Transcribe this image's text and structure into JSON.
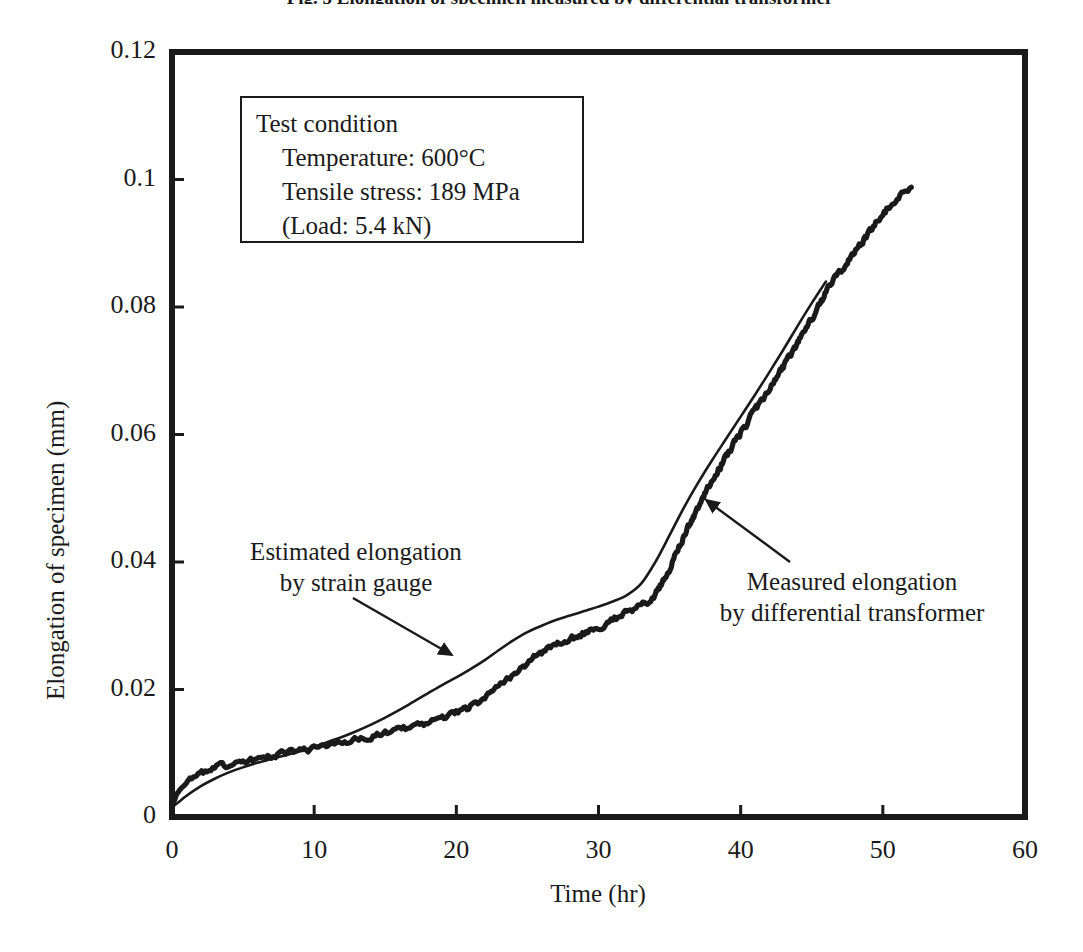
{
  "figure": {
    "caption": "Fig. 5  Elongation of specimen measured by differential transformer"
  },
  "chart_data": {
    "type": "line",
    "title": "",
    "xlabel": "Time (hr)",
    "ylabel": "Elongation of specimen (mm)",
    "xlim": [
      0,
      60
    ],
    "ylim": [
      0,
      0.12
    ],
    "xticks": [
      "0",
      "10",
      "20",
      "30",
      "40",
      "50",
      "60"
    ],
    "xtick_values": [
      0,
      10,
      20,
      30,
      40,
      50,
      60
    ],
    "yticks": [
      "0",
      "0.02",
      "0.04",
      "0.06",
      "0.08",
      "0.1",
      "0.12"
    ],
    "ytick_values": [
      0,
      0.02,
      0.04,
      0.06,
      0.08,
      0.1,
      0.12
    ],
    "grid": false,
    "legend": "none",
    "series": [
      {
        "name": "Measured elongation by differential transformer",
        "style": "noisy-thick",
        "color": "#1a1a1a",
        "x": [
          0.0,
          0.4,
          0.9,
          1.5,
          2.2,
          3.0,
          3.8,
          4.6,
          5.4,
          6.2,
          7.0,
          8.0,
          9.0,
          10.0,
          11.0,
          12.0,
          13.0,
          14.0,
          15.0,
          16.0,
          17.0,
          18.0,
          19.0,
          20.0,
          21.0,
          22.0,
          23.0,
          24.0,
          25.0,
          26.0,
          27.0,
          28.0,
          29.0,
          30.0,
          31.0,
          32.0,
          33.0,
          34.0,
          35.0,
          36.0,
          37.0,
          38.0,
          39.0,
          40.0,
          41.0,
          42.0,
          43.0,
          44.0,
          45.0,
          46.0,
          47.0,
          48.0,
          49.0,
          50.0,
          51.0,
          52.0
        ],
        "y": [
          0.002,
          0.0038,
          0.0052,
          0.0062,
          0.007,
          0.0077,
          0.0082,
          0.0086,
          0.009,
          0.0093,
          0.0096,
          0.01,
          0.0104,
          0.0108,
          0.0112,
          0.0116,
          0.0121,
          0.0126,
          0.0131,
          0.0136,
          0.0142,
          0.0148,
          0.0155,
          0.0163,
          0.0173,
          0.0186,
          0.0203,
          0.0222,
          0.0242,
          0.0258,
          0.027,
          0.0279,
          0.0288,
          0.0297,
          0.0308,
          0.0322,
          0.033,
          0.0348,
          0.039,
          0.044,
          0.0487,
          0.0528,
          0.0566,
          0.0602,
          0.0638,
          0.0672,
          0.0706,
          0.0742,
          0.0782,
          0.0824,
          0.0856,
          0.0886,
          0.0916,
          0.0945,
          0.0972,
          0.099
        ]
      },
      {
        "name": "Estimated elongation by strain gauge",
        "style": "smooth-thin",
        "color": "#1a1a1a",
        "x": [
          0.0,
          0.5,
          1.0,
          2.0,
          3.0,
          4.0,
          5.0,
          6.0,
          7.0,
          8.0,
          9.0,
          10.0,
          11.0,
          12.0,
          13.0,
          14.0,
          15.0,
          16.0,
          17.0,
          18.0,
          19.0,
          20.0,
          21.0,
          22.0,
          23.0,
          24.0,
          25.0,
          26.0,
          27.0,
          28.0,
          29.0,
          30.0,
          31.0,
          32.0,
          33.0,
          34.0,
          35.0,
          36.0,
          37.0,
          38.0,
          39.0,
          40.0,
          41.0,
          42.0,
          43.0,
          44.0,
          45.0,
          46.0
        ],
        "y": [
          0.0015,
          0.0024,
          0.0033,
          0.0048,
          0.006,
          0.007,
          0.0078,
          0.0085,
          0.0091,
          0.0097,
          0.0103,
          0.011,
          0.0118,
          0.0126,
          0.0135,
          0.0145,
          0.0156,
          0.0168,
          0.0181,
          0.0194,
          0.0207,
          0.0219,
          0.0232,
          0.0246,
          0.0262,
          0.0277,
          0.029,
          0.03,
          0.0309,
          0.0316,
          0.0323,
          0.033,
          0.0338,
          0.0348,
          0.0366,
          0.04,
          0.0442,
          0.0485,
          0.0524,
          0.056,
          0.0594,
          0.0628,
          0.0662,
          0.0697,
          0.0733,
          0.077,
          0.0806,
          0.084
        ]
      }
    ],
    "annotations": [
      {
        "id": "estimated",
        "lines": [
          "Estimated elongation",
          "by strain gauge"
        ],
        "text_x": 356,
        "text_y": 536,
        "arrow_from_x": 353,
        "arrow_from_y": 598,
        "arrow_to_x": 452,
        "arrow_to_y": 655
      },
      {
        "id": "measured",
        "lines": [
          "Measured elongation",
          "by differential transformer"
        ],
        "text_x": 852,
        "text_y": 566,
        "arrow_from_x": 790,
        "arrow_from_y": 562,
        "arrow_to_x": 706,
        "arrow_to_y": 500
      }
    ],
    "textbox": {
      "title": "Test condition",
      "lines": [
        "Temperature: 600°C",
        "Tensile stress: 189 MPa",
        "(Load: 5.4 kN)"
      ]
    }
  }
}
